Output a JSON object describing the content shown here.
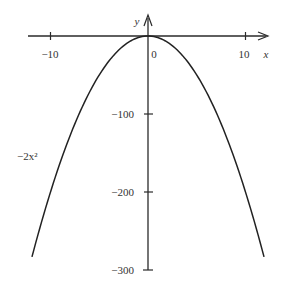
{
  "chart_data": {
    "type": "line",
    "title": "",
    "function_label": "−2x²",
    "xlabel": "x",
    "ylabel": "y",
    "xlim": [
      -12,
      12
    ],
    "ylim": [
      -300,
      0
    ],
    "x_ticks": [
      {
        "value": -10,
        "label": "−10"
      },
      {
        "value": 0,
        "label": "0"
      },
      {
        "value": 10,
        "label": "10"
      }
    ],
    "y_ticks": [
      {
        "value": -100,
        "label": "−100"
      },
      {
        "value": -200,
        "label": "−200"
      },
      {
        "value": -300,
        "label": "−300"
      }
    ],
    "grid": false,
    "legend": "none",
    "series": [
      {
        "name": "−2x²",
        "x": [
          -11.9,
          -10,
          -8,
          -6,
          -4,
          -2,
          0,
          2,
          4,
          6,
          8,
          10,
          11.9
        ],
        "y": [
          -283.2,
          -200,
          -128,
          -72,
          -32,
          -8,
          0,
          -8,
          -32,
          -72,
          -128,
          -200,
          -283.2
        ]
      }
    ]
  }
}
